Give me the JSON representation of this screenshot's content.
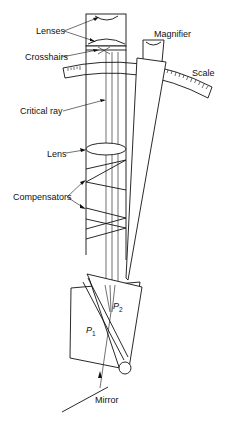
{
  "diagram": {
    "labels": {
      "lenses": "Lenses",
      "crosshairs": "Crosshairs",
      "critical_ray": "Critical ray",
      "lens": "Lens",
      "compensators": "Compensators",
      "magnifier": "Magnifier",
      "scale": "Scale",
      "mirror": "Mirror",
      "p1": "P",
      "p1_sub": "1",
      "p2": "P",
      "p2_sub": "2"
    },
    "colors": {
      "line": "#111111",
      "background": "#ffffff"
    }
  }
}
